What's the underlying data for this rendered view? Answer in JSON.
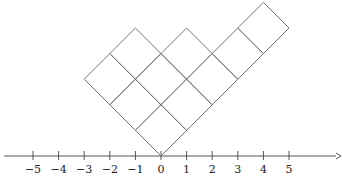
{
  "diagram": {
    "type": "young-diagram-russian-notation",
    "partition": [
      5,
      3,
      2
    ],
    "axis": {
      "ticks": [
        -5,
        -4,
        -3,
        -2,
        -1,
        0,
        1,
        2,
        3,
        4,
        5
      ],
      "tick_labels": [
        "−5",
        "−4",
        "−3",
        "−2",
        "−1",
        "0",
        "1",
        "2",
        "3",
        "4",
        "5"
      ]
    },
    "colors": {
      "line": "#777777",
      "axis": "#555555",
      "text": "#222222"
    }
  }
}
